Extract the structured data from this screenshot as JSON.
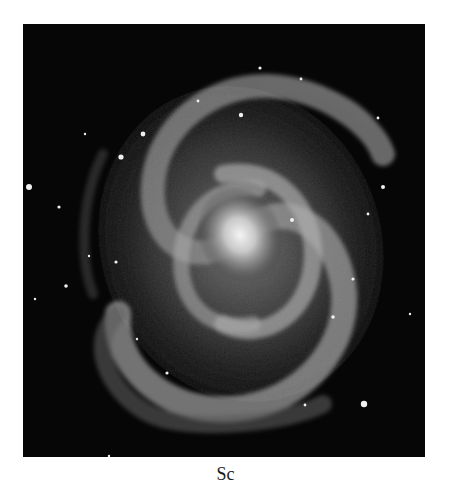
{
  "figure": {
    "caption": "Sc",
    "colors": {
      "background": "#ffffff",
      "sky": "#060606",
      "core": "#f2f2f2",
      "arms": "#9a9a9a"
    }
  }
}
